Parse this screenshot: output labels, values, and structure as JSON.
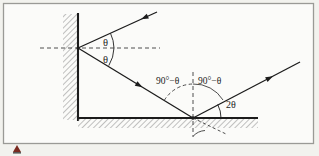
{
  "figure": {
    "kind": "optics-ray-diagram",
    "background_color": "#f2f2ee",
    "border_color": "#9a9a96",
    "line_color": "#1c1c1c",
    "hatch_color": "#8c8c8c",
    "marker_color": "#7a2a20",
    "labels": {
      "wall_angle_top": "θ",
      "wall_angle_bottom": "θ",
      "ground_angle_left": "90°−θ",
      "ground_angle_right": "90°−θ",
      "deviation_angle": "2θ"
    },
    "elements": {
      "wall": "vertical-hatched-wall",
      "ground": "horizontal-hatched-ground",
      "incident_ray": "incoming-ray-to-wall",
      "reflected_ray": "wall-to-ground-ray",
      "outgoing_ray": "ground-to-exit-ray",
      "wall_normal": "dashed-horizontal-normal",
      "ground_normal": "dashed-vertical-normal",
      "corner_marker": "red-triangle-marker"
    }
  }
}
